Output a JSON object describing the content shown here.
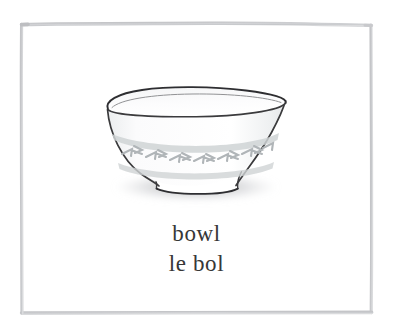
{
  "card": {
    "name": "flashcard-bowl",
    "background_color": "#ffffff",
    "width": 393,
    "height": 332
  },
  "frame": {
    "name": "hand-drawn-border",
    "color": "#c9cacc",
    "color_light": "#dcdddf",
    "stroke_width": 3.2,
    "left": 21,
    "top": 23,
    "right": 372,
    "bottom": 313
  },
  "illustration": {
    "name": "bowl-illustration",
    "subject": "bowl",
    "style": "watercolor-line-drawing",
    "outline_color": "#3a3a3c",
    "fill_color": "#fdfdfd",
    "body_shade_color": "#f2f3f4",
    "band_color": "#c2c6c8",
    "band_motif_color": "#b4b9bc",
    "shadow_color": "#c6c7c9",
    "parts": [
      "rim",
      "interior",
      "body",
      "decorative-band",
      "pedestal-foot",
      "cast-shadow"
    ]
  },
  "caption": {
    "primary": "bowl",
    "primary_language": "english",
    "secondary": "le bol",
    "secondary_language": "french",
    "text_color": "#373737"
  }
}
